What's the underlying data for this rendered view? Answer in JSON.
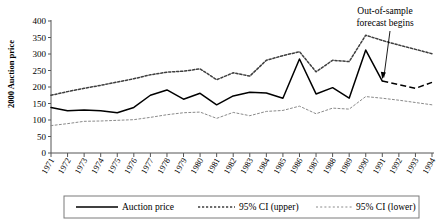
{
  "chart_data": {
    "type": "line",
    "title": "",
    "xlabel": "",
    "ylabel": "2000 Auction price",
    "ylim": [
      0,
      400
    ],
    "ytick_step": 50,
    "yticks": [
      "0",
      "50",
      "100",
      "150",
      "200",
      "250",
      "300",
      "350",
      "400"
    ],
    "grid": false,
    "legend_position": "bottom",
    "categories": [
      "1971",
      "1972",
      "1973",
      "1974",
      "1975",
      "1976",
      "1977",
      "1978",
      "1979",
      "1980",
      "1981",
      "1982",
      "1983",
      "1984",
      "1985",
      "1986",
      "1987",
      "1988",
      "1989",
      "1990",
      "1991",
      "1992",
      "1993",
      "1994"
    ],
    "series": [
      {
        "name": "Auction price",
        "style": "solid",
        "values": [
          138,
          128,
          130,
          128,
          122,
          138,
          175,
          191,
          163,
          181,
          146,
          173,
          184,
          182,
          166,
          285,
          179,
          198,
          166,
          312,
          218,
          207,
          196,
          214
        ]
      },
      {
        "name": "95% CI (upper)",
        "style": "dotted-thick",
        "values": [
          175,
          186,
          196,
          205,
          215,
          225,
          237,
          245,
          248,
          255,
          222,
          243,
          233,
          281,
          295,
          307,
          246,
          281,
          277,
          357,
          341,
          327,
          314,
          301
        ]
      },
      {
        "name": "95% CI (lower)",
        "style": "dotted-thin",
        "values": [
          83,
          89,
          96,
          97,
          99,
          101,
          108,
          116,
          122,
          124,
          105,
          123,
          113,
          126,
          129,
          142,
          119,
          136,
          133,
          171,
          166,
          160,
          153,
          146
        ]
      }
    ],
    "annotations": [
      {
        "name": "out-of-sample-forecast",
        "line1": "Out-of-sample",
        "line2": "forecast begins",
        "points_to_year": "1991",
        "points_to_value": 218
      }
    ],
    "forecast_start_year": "1991",
    "colors": {
      "auction_price": "#000000",
      "ci_upper": "#3f3f3f",
      "ci_lower": "#8a8a8a",
      "axis": "#555555",
      "background": "#ffffff"
    }
  },
  "legend": {
    "items": [
      {
        "label": "Auction price"
      },
      {
        "label": "95% CI (upper)"
      },
      {
        "label": "95% CI (lower)"
      }
    ]
  }
}
